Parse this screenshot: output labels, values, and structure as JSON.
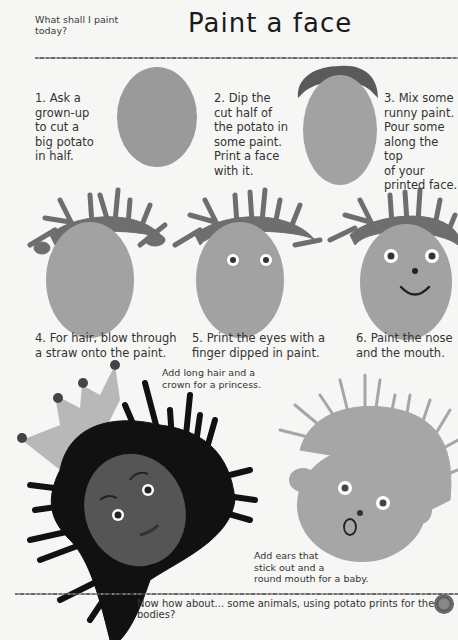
{
  "header": {
    "question": "What shall I paint today?",
    "title": "Paint a face"
  },
  "steps": [
    {
      "number": "1.",
      "text": "1. Ask a grown-up to cut a big potato in half.",
      "lines": [
        "1. Ask a",
        "grown-up",
        "to cut a",
        "big potato",
        "in half."
      ]
    },
    {
      "number": "2.",
      "text": "2. Dip the cut half of the potato in some paint. Print a face with it.",
      "lines": [
        "2. Dip the",
        "cut half of",
        "the potato in",
        "some paint.",
        "Print a face",
        "with it."
      ]
    },
    {
      "number": "3.",
      "text": "3. Mix some runny paint. Pour some along the top of your printed face.",
      "lines": [
        "3. Mix some",
        "runny paint.",
        "Pour some",
        "along the top",
        "of your",
        "printed face."
      ]
    },
    {
      "number": "4.",
      "text": "4. For hair, blow through a straw onto the paint.",
      "lines": [
        "4. For hair, blow through",
        "a straw onto the paint."
      ]
    },
    {
      "number": "5.",
      "text": "5. Print the eyes with a finger dipped in paint.",
      "lines": [
        "5. Print the eyes with a",
        "finger dipped in paint."
      ]
    },
    {
      "number": "6.",
      "text": "6. Paint the nose and the mouth.",
      "lines": [
        "6. Paint the nose",
        "and the mouth."
      ]
    }
  ],
  "notes": {
    "princess": [
      "Add long hair and a",
      "crown for a princess."
    ],
    "baby": [
      "Add ears that",
      "stick out and a",
      "round mouth for a baby."
    ]
  },
  "footer": {
    "text": "Now how about... some animals, using potato prints for the bodies?",
    "badge_icon": "lion-face-icon"
  },
  "colors": {
    "background": "#f6f6f4",
    "paint_light": "#a3a3a3",
    "paint_mid": "#8c8c8c",
    "paint_dark": "#5e5e5e",
    "ink_black": "#111111",
    "eye_white": "#ffffff"
  }
}
